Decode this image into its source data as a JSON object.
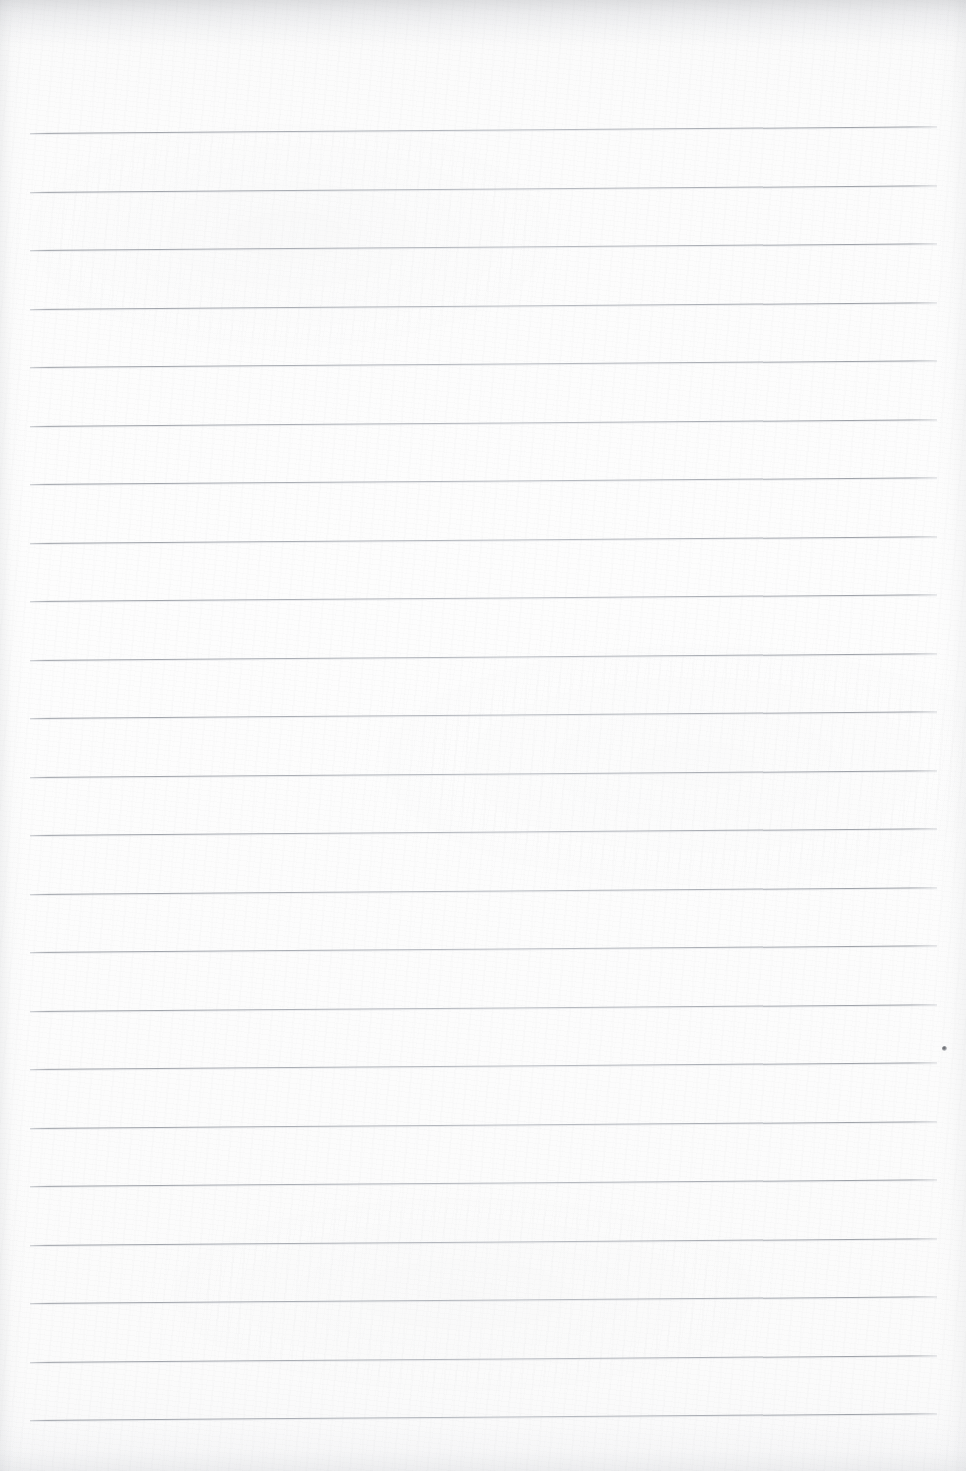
{
  "document": {
    "kind": "scanned-lined-paper",
    "title": "Blank ruled notebook page",
    "content_text": "",
    "page_width": 966,
    "page_height": 1471
  },
  "paper": {
    "background_color": "#fbfbfb",
    "base_tint_color": "#fdfdfd",
    "edge_shadow_color": "#a9acb2",
    "texture": "faint-scan-noise",
    "orientation": "portrait"
  },
  "ruling": {
    "line_color": "#9ba0a7",
    "line_thickness_px": 1,
    "line_count": 23,
    "line_spacing_px": 58.5,
    "left_x_px": 30,
    "right_x_px": 937,
    "first_line_y_px": 133,
    "skew_degrees": -0.42,
    "line_y_positions": [
      133,
      191.5,
      250,
      308.5,
      367,
      425.5,
      484,
      542.5,
      601,
      659.5,
      718,
      776.5,
      835,
      893.5,
      952,
      1010.5,
      1069,
      1127.5,
      1186,
      1244.5,
      1303,
      1361.5,
      1420
    ]
  },
  "artifacts": {
    "items": [
      {
        "name": "ink-speck",
        "x_px": 944,
        "y_px": 1048,
        "size_px": 5,
        "color": "#46484e"
      }
    ]
  }
}
